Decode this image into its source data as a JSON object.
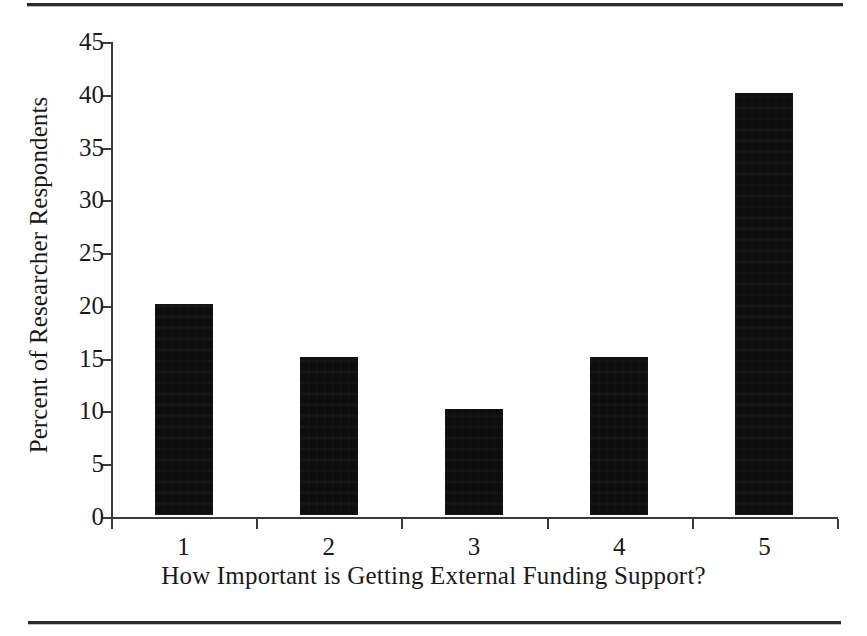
{
  "chart_data": {
    "type": "bar",
    "title": "",
    "subtitle": "",
    "xlabel": "How Important is Getting External Funding Support?",
    "ylabel": "Percent of Researcher Respondents",
    "categories": [
      "1",
      "2",
      "3",
      "4",
      "5"
    ],
    "values": [
      20,
      15,
      10,
      15,
      40
    ],
    "ylim": [
      0,
      45
    ],
    "ytick_values": [
      0,
      5,
      10,
      15,
      20,
      25,
      30,
      35,
      40,
      45
    ],
    "ytick_labels": [
      "0",
      "5",
      "10",
      "15",
      "20",
      "25",
      "30",
      "35",
      "40",
      "45"
    ],
    "grid": false,
    "legend": null,
    "bar_color": "#0d0d0d",
    "axis_color": "#3a3a3a",
    "background_color": "#ffffff"
  },
  "figure": {
    "rule_top_label": "top-horizontal-rule",
    "rule_bottom_label": "bottom-horizontal-rule"
  }
}
